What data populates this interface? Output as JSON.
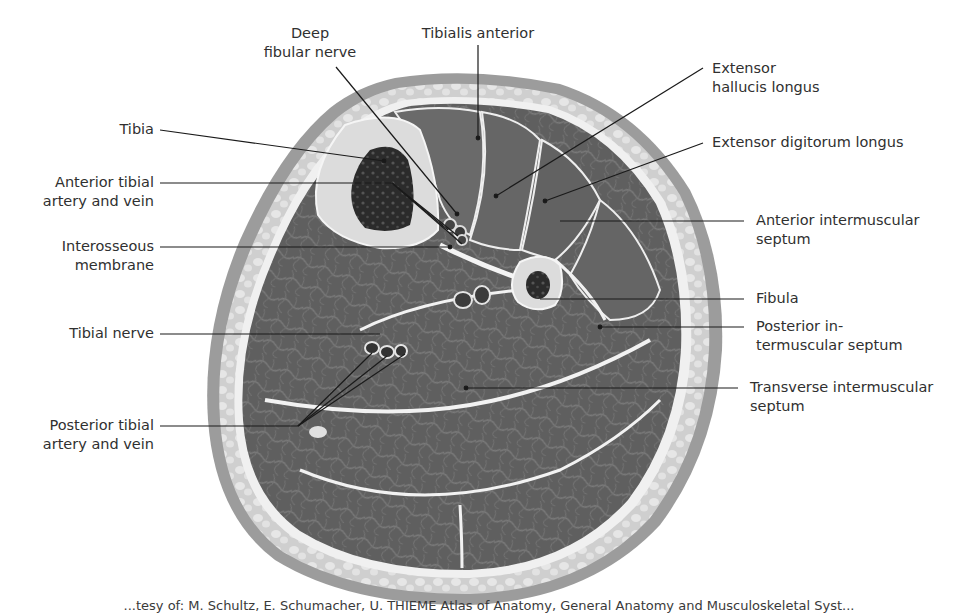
{
  "figure": {
    "palette": {
      "background": "#ffffff",
      "skin": "#9a9a9a",
      "subcutaneous_fat": "#d6d6d6",
      "fascia": "#f2f2f2",
      "muscle": "#5e5e5e",
      "muscle_light": "#6e6e6e",
      "bone_cortex": "#dcdcdc",
      "bone_marrow": "#2a2a2a",
      "leader_line": "#1a1a1a",
      "text": "#303030"
    }
  },
  "labels": {
    "left": [
      {
        "id": "tibia",
        "lines": [
          "Tibia"
        ]
      },
      {
        "id": "anterior-tibial-artery-vein",
        "lines": [
          "Anterior tibial",
          "artery and vein"
        ]
      },
      {
        "id": "interosseous-membrane",
        "lines": [
          "Interosseous",
          "membrane"
        ]
      },
      {
        "id": "tibial-nerve",
        "lines": [
          "Tibial nerve"
        ]
      },
      {
        "id": "posterior-tibial-artery-vein",
        "lines": [
          "Posterior tibial",
          "artery and vein"
        ]
      }
    ],
    "top": [
      {
        "id": "deep-fibular-nerve",
        "lines": [
          "Deep",
          "fibular nerve"
        ]
      },
      {
        "id": "tibialis-anterior",
        "lines": [
          "Tibialis anterior"
        ]
      }
    ],
    "right": [
      {
        "id": "extensor-hallucis-longus",
        "lines": [
          "Extensor",
          "hallucis longus"
        ]
      },
      {
        "id": "extensor-digitorum-longus",
        "lines": [
          "Extensor digitorum longus"
        ]
      },
      {
        "id": "anterior-intermuscular-septum",
        "lines": [
          "Anterior intermuscular",
          "septum"
        ]
      },
      {
        "id": "fibula",
        "lines": [
          "Fibula"
        ]
      },
      {
        "id": "posterior-intermuscular-septum",
        "lines": [
          "Posterior in-",
          "termuscular septum"
        ]
      },
      {
        "id": "transverse-intermuscular-septum",
        "lines": [
          "Transverse intermuscular",
          "septum"
        ]
      }
    ]
  },
  "caption": {
    "text": "...tesy of: M. Schultz, E. Schumacher, U. THIEME Atlas of Anatomy, General Anatomy and Musculoskeletal Syst..."
  }
}
